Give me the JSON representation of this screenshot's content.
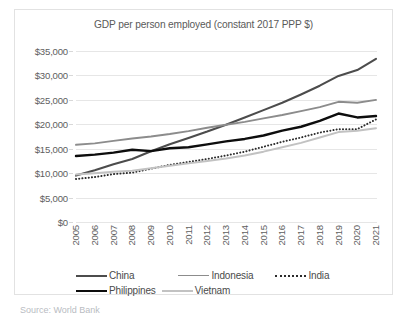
{
  "chart_data": {
    "type": "line",
    "title": "GDP per person employed (constant 2017 PPP $)",
    "xlabel": "",
    "ylabel": "",
    "grid": true,
    "legend_position": "bottom",
    "ylim": [
      0,
      35000
    ],
    "ytick_step": 5000,
    "ytick_labels": [
      "$35,000",
      "$30,000",
      "$25,000",
      "$20,000",
      "$15,000",
      "$10,000",
      "$5,000",
      "$0"
    ],
    "ytick_values": [
      35000,
      30000,
      25000,
      20000,
      15000,
      10000,
      5000,
      0
    ],
    "categories": [
      "2005",
      "2006",
      "2007",
      "2008",
      "2009",
      "2010",
      "2011",
      "2012",
      "2013",
      "2014",
      "2015",
      "2016",
      "2017",
      "2018",
      "2019",
      "2020",
      "2021"
    ],
    "series": [
      {
        "name": "China",
        "color": "#4c4c4c",
        "style": "solid",
        "width": 2.1,
        "values": [
          9500,
          10600,
          11800,
          12900,
          14500,
          15900,
          17200,
          18500,
          19900,
          21400,
          22900,
          24400,
          26100,
          27900,
          29900,
          31100,
          33400
        ]
      },
      {
        "name": "Indonesia",
        "color": "#8c8c8c",
        "style": "solid",
        "width": 1.9,
        "values": [
          15800,
          16100,
          16600,
          17100,
          17500,
          18000,
          18600,
          19300,
          19900,
          20500,
          21200,
          21900,
          22700,
          23500,
          24600,
          24400,
          25000
        ]
      },
      {
        "name": "India",
        "color": "#2b2b2b",
        "style": "dotted",
        "width": 2.0,
        "values": [
          8800,
          9200,
          9800,
          10100,
          10900,
          11700,
          12300,
          12900,
          13600,
          14400,
          15400,
          16400,
          17300,
          18300,
          19000,
          19000,
          21000
        ]
      },
      {
        "name": "Philippines",
        "color": "#0d0d0d",
        "style": "solid",
        "width": 2.4,
        "values": [
          13500,
          13800,
          14200,
          14800,
          14500,
          15100,
          15300,
          15900,
          16500,
          17000,
          17700,
          18700,
          19500,
          20700,
          22200,
          21400,
          21700
        ]
      },
      {
        "name": "Vietnam",
        "color": "#c2c2c2",
        "style": "solid",
        "width": 2.0,
        "values": [
          9700,
          10000,
          10300,
          10500,
          11000,
          11500,
          12000,
          12500,
          13000,
          13600,
          14400,
          15300,
          16200,
          17300,
          18400,
          18700,
          19200
        ]
      }
    ]
  },
  "source": {
    "text": "Source: World Bank"
  }
}
